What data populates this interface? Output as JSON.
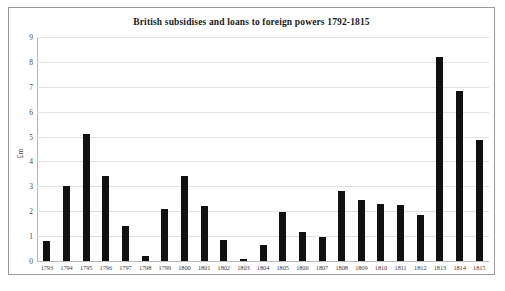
{
  "chart_data": {
    "type": "bar",
    "title": "British subsidises and loans to foreign powers 1792-1815",
    "xlabel": "",
    "ylabel": "£m",
    "ylim": [
      0,
      9
    ],
    "ytick_step": 1,
    "yticks": [
      "9",
      "8",
      "7",
      "6",
      "5",
      "4",
      "3",
      "2",
      "1",
      "0"
    ],
    "grid": true,
    "legend": "none",
    "bar_color": "#111111",
    "categories": [
      "1793",
      "1794",
      "1795",
      "1796",
      "1797",
      "1798",
      "1799",
      "1800",
      "1801",
      "1802",
      "1803",
      "1804",
      "1805",
      "1806",
      "1807",
      "1808",
      "1809",
      "1810",
      "1811",
      "1812",
      "1813",
      "1814",
      "1815"
    ],
    "values": [
      0.8,
      3.0,
      5.1,
      3.4,
      1.4,
      0.2,
      2.1,
      3.4,
      2.2,
      0.85,
      0.1,
      0.65,
      1.95,
      1.15,
      0.95,
      2.8,
      2.45,
      2.3,
      2.25,
      1.85,
      8.2,
      6.85,
      4.85
    ]
  },
  "caption": ""
}
